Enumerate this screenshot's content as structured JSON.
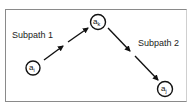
{
  "diagram": {
    "labels": {
      "subpath1": "Subpath 1",
      "subpath2": "Subpath 2"
    },
    "nodes": [
      {
        "id": "ai",
        "base": "a",
        "sub": "i"
      },
      {
        "id": "ak",
        "base": "a",
        "sub": "k"
      },
      {
        "id": "aj",
        "base": "a",
        "sub": "j"
      }
    ],
    "edges": [
      {
        "from": "ai",
        "to": "ak",
        "style": "dashed-arrow"
      },
      {
        "from": "ak",
        "to": "aj",
        "style": "dashed-arrow"
      }
    ]
  }
}
